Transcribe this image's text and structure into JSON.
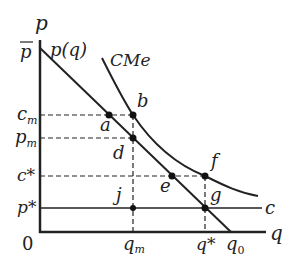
{
  "diagram": {
    "type": "monopoly-natural-monopoly-cost-diagram",
    "axes": {
      "y_label": "p",
      "x_label": "q",
      "origin_label": "0"
    },
    "curves": {
      "demand": "p(q)",
      "average_cost": "CMe",
      "marginal_cost": "c"
    },
    "y_ticks": {
      "p_bar": "p",
      "c_m": "c",
      "c_m_sub": "m",
      "p_m": "p",
      "p_m_sub": "m",
      "c_star": "c*",
      "p_star": "p*"
    },
    "x_ticks": {
      "q_m": "q",
      "q_m_sub": "m",
      "q_star": "q*",
      "q_0": "q",
      "q_0_sub": "0"
    },
    "points": {
      "a": "a",
      "b": "b",
      "d": "d",
      "e": "e",
      "f": "f",
      "g": "g",
      "j": "j"
    },
    "colors": {
      "line": "#222222",
      "background": "#ffffff"
    }
  }
}
